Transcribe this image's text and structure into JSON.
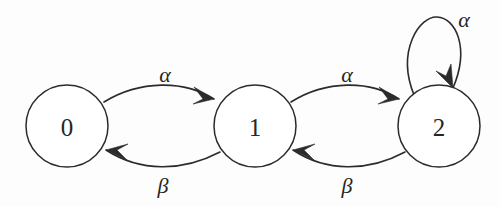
{
  "diagram": {
    "type": "finite-state-machine",
    "title": "",
    "background_color": "#fdfdfd",
    "stroke_color": "#2b2b2b",
    "states": [
      {
        "id": "0",
        "label": "0",
        "cx": 67,
        "cy": 126,
        "r": 41
      },
      {
        "id": "1",
        "label": "1",
        "cx": 255,
        "cy": 126,
        "r": 41
      },
      {
        "id": "2",
        "label": "2",
        "cx": 439,
        "cy": 126,
        "r": 41
      }
    ],
    "transitions": [
      {
        "name": "zero-to-one",
        "from": "0",
        "to": "1",
        "label": "α",
        "label_x": 165,
        "label_y": 74,
        "path": "M 104 102 C 140 80, 184 80, 214 99",
        "arrow": "M 214 99 L 194 87 L 203 99 L 193 104 Z"
      },
      {
        "name": "one-to-zero",
        "from": "1",
        "to": "0",
        "label": "β",
        "label_x": 163,
        "label_y": 185,
        "path": "M 220 152 C 182 172, 140 172, 106 150",
        "arrow": "M 106 150 L 127 160 L 117 150 L 128 144 Z"
      },
      {
        "name": "one-to-two",
        "from": "1",
        "to": "2",
        "label": "α",
        "label_x": 347,
        "label_y": 74,
        "path": "M 291 102 C 326 80, 370 80, 399 99",
        "arrow": "M 399 99 L 379 87 L 388 99 L 378 104 Z"
      },
      {
        "name": "two-to-one",
        "from": "2",
        "to": "1",
        "label": "β",
        "label_x": 347,
        "label_y": 185,
        "path": "M 405 152 C 368 172, 326 172, 293 150",
        "arrow": "M 293 150 L 314 160 L 304 150 L 315 144 Z"
      },
      {
        "name": "two-self-loop",
        "from": "2",
        "to": "2",
        "label": "α",
        "label_x": 464,
        "label_y": 19,
        "path": "M 414 95 C 396 50, 420 16, 437 17 C 456 18, 470 48, 453 88",
        "arrow": "M 453 88 L 451 64 L 446 76 L 436 71 Z"
      }
    ]
  }
}
